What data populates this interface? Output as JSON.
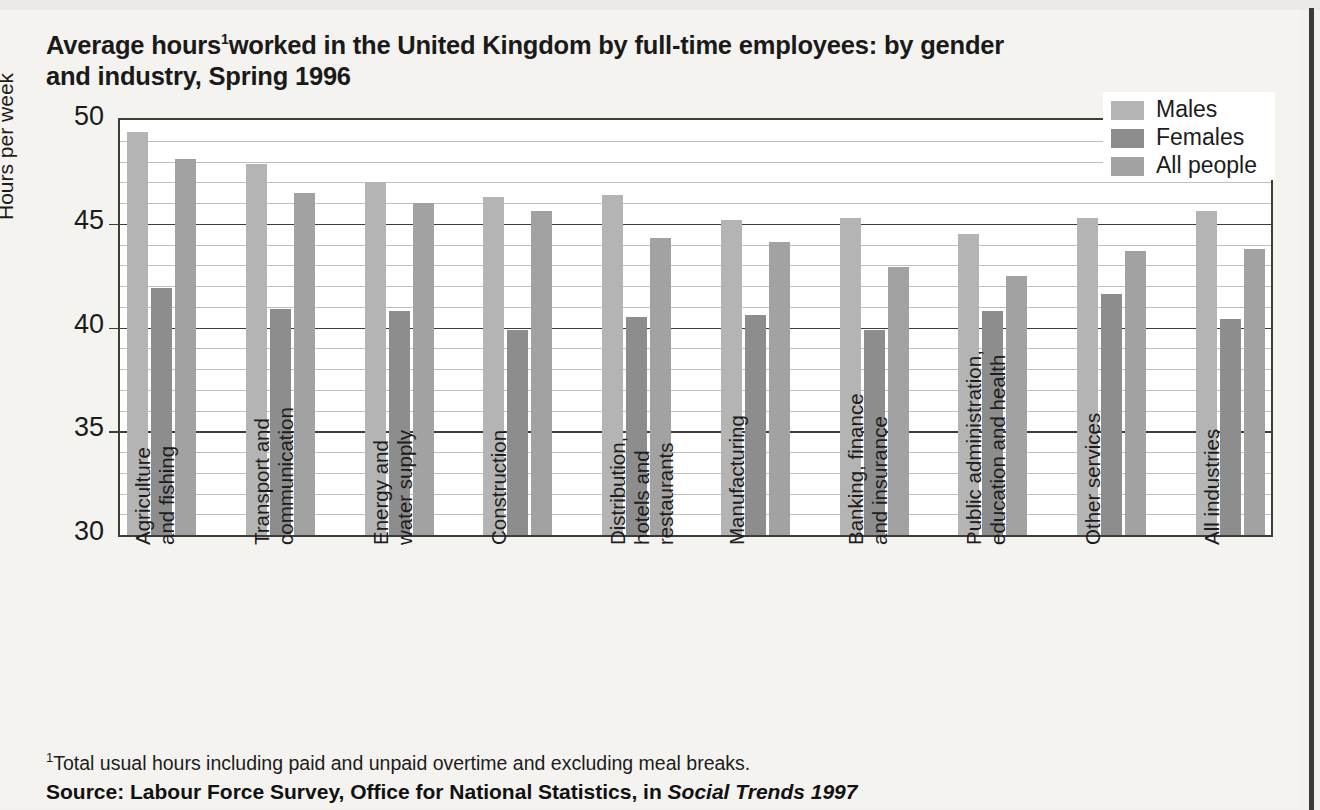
{
  "title": {
    "line1_prefix": "Average hours",
    "footnote_marker": "1",
    "line1_suffix": "worked in the United Kingdom by full-time employees: by gender",
    "line2": "and industry, Spring 1996"
  },
  "footnote": {
    "marker": "1",
    "text": "Total usual hours including paid and unpaid overtime and excluding meal breaks."
  },
  "source": {
    "label": "Source:",
    "text": " Labour Force Survey, Office for National Statistics, in ",
    "publication": "Social Trends 1997"
  },
  "legend": {
    "items": [
      {
        "label": "Males",
        "color": "#b4b4b4"
      },
      {
        "label": "Females",
        "color": "#8d8d8d"
      },
      {
        "label": "All people",
        "color": "#a2a2a2"
      }
    ]
  },
  "chart_data": {
    "type": "bar",
    "xlabel": "",
    "ylabel": "Hours per week",
    "ylim": [
      30,
      50
    ],
    "yticks": [
      30,
      35,
      40,
      45,
      50
    ],
    "ytick_labels": [
      "30",
      "35",
      "40",
      "45",
      "50"
    ],
    "minor_gridlines": [
      31,
      32,
      33,
      34,
      36,
      37,
      38,
      39,
      41,
      42,
      43,
      44,
      46,
      47,
      48,
      49
    ],
    "grid": true,
    "legend_position": "top-right",
    "categories": [
      "Agriculture and fishing",
      "Transport and communication",
      "Energy and water supply",
      "Construction",
      "Distribution, hotels and restaurants",
      "Manufacturing",
      "Banking, finance and insurance",
      "Public administration, education and health",
      "Other services",
      "All industries"
    ],
    "category_lines": [
      [
        "Agriculture",
        "and fishing"
      ],
      [
        "Transport and",
        "communication"
      ],
      [
        "Energy and",
        "water supply"
      ],
      [
        "Construction",
        ""
      ],
      [
        "Distribution,",
        "hotels and",
        "restaurants"
      ],
      [
        "Manufacturing",
        ""
      ],
      [
        "Banking, finance",
        "and insurance"
      ],
      [
        "Public administration,",
        "education and health"
      ],
      [
        "Other services",
        ""
      ],
      [
        "All industries",
        ""
      ]
    ],
    "series": [
      {
        "name": "Males",
        "color": "#b4b4b4",
        "values": [
          49.4,
          47.9,
          47.0,
          46.3,
          46.4,
          45.2,
          45.3,
          44.5,
          45.3,
          45.6
        ]
      },
      {
        "name": "Females",
        "color": "#8d8d8d",
        "values": [
          41.9,
          40.9,
          40.8,
          39.9,
          40.5,
          40.6,
          39.9,
          40.8,
          41.6,
          40.4
        ]
      },
      {
        "name": "All people",
        "color": "#a2a2a2",
        "values": [
          48.1,
          46.5,
          46.0,
          45.6,
          44.3,
          44.1,
          42.9,
          42.5,
          43.7,
          43.8
        ]
      }
    ]
  }
}
